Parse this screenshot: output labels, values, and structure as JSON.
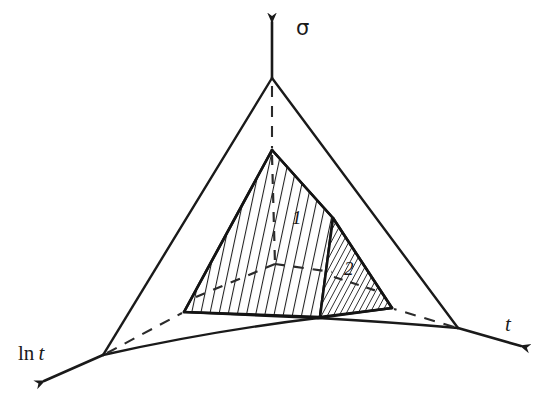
{
  "figure": {
    "type": "3d-axes-schematic-diagram",
    "background_color": "#ffffff",
    "line_color": "#1a1a1a",
    "axes": [
      {
        "name": "sigma-axis",
        "label": "σ",
        "direction": "up",
        "arrow": true
      },
      {
        "name": "ln-t-axis",
        "label_prefix": "ln",
        "label_var": "t",
        "label": "ln t",
        "direction": "down-left",
        "arrow": true
      },
      {
        "name": "t-axis",
        "label": "t",
        "direction": "down-right",
        "arrow": true
      }
    ],
    "labels": {
      "sigma": "σ",
      "ln_prefix": "ln ",
      "ln_var": "t",
      "t": "t"
    },
    "regions": [
      {
        "name": "region-1",
        "label": "1",
        "hatch": "near-vertical",
        "description": "large shaded triangular surface"
      },
      {
        "name": "region-2",
        "label": "2",
        "hatch": "steep-diagonal",
        "description": "small shaded triangular surface on right"
      }
    ],
    "geometry": {
      "outer_triangle": {
        "apex": [
          272,
          78
        ],
        "left": [
          103,
          355
        ],
        "right": [
          458,
          328
        ]
      },
      "inner_triangle": {
        "apex": [
          272,
          150
        ],
        "left": [
          184,
          312
        ],
        "right": [
          392,
          308
        ],
        "center_bottom": [
          318,
          318
        ]
      },
      "sigma_axis_tip": [
        272,
        14
      ],
      "lnt_axis_tip": [
        34,
        386
      ],
      "t_axis_tip": [
        531,
        349
      ]
    }
  }
}
